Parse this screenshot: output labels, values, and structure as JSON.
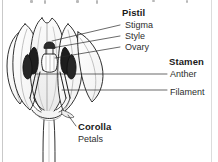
{
  "figure": {
    "style": "black-and-white line drawing",
    "background_color": "#ffffff",
    "ink_color": "#231f20",
    "rule_color": "#c9c9c9"
  },
  "labels": {
    "pistil": {
      "heading": "Pistil",
      "parts": [
        {
          "name": "Stigma"
        },
        {
          "name": "Style"
        },
        {
          "name": "Ovary"
        }
      ]
    },
    "stamen": {
      "heading": "Stamen",
      "parts": [
        {
          "name": "Anther"
        },
        {
          "name": "Filament"
        }
      ]
    },
    "corolla": {
      "heading": "Corolla",
      "parts": [
        {
          "name": "Petals"
        }
      ]
    }
  }
}
